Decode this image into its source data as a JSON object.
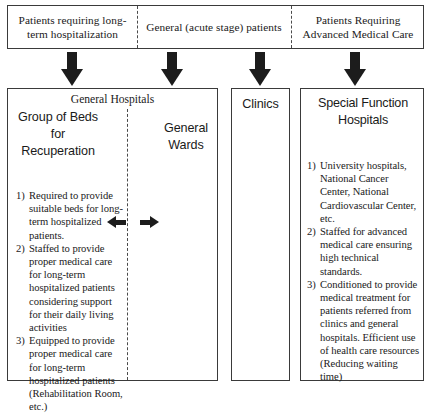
{
  "diagram": {
    "top_band": {
      "segments": [
        {
          "label": "Patients requiring long-term hospitalization"
        },
        {
          "label": "General (acute stage) patients"
        },
        {
          "label": "Patients Requiring Advanced Medical Care"
        }
      ]
    },
    "arrows": {
      "down_icon": "arrow-down-icon",
      "left_icon": "arrow-left-icon",
      "right_icon": "arrow-right-icon",
      "count": 4,
      "color": "#1c1c1c"
    },
    "general_hospitals": {
      "title": "General Hospitals",
      "left_column_title": "Group of Beds for Recuperation",
      "right_column_title": "General Wards",
      "items": [
        {
          "num": "1)",
          "text": "Required to provide suitable beds for long-term hospitalized patients."
        },
        {
          "num": "2)",
          "text": "Staffed to provide proper medical care for long-term hospitalized patients considering support for their daily living activities"
        },
        {
          "num": "3)",
          "text": "Equipped to provide proper medical care for long-term hospitalized patients (Rehabilitation Room, etc.)"
        }
      ]
    },
    "clinics": {
      "title": "Clinics"
    },
    "special_function_hospitals": {
      "title": "Special Function Hospitals",
      "items": [
        {
          "num": "1)",
          "text": "University hospitals, National Cancer Center, National Cardiovascular Center, etc."
        },
        {
          "num": "2)",
          "text": "Staffed for advanced medical care ensuring high technical standards."
        },
        {
          "num": "3)",
          "text": "Conditioned to provide medical treatment for patients referred from clinics and general hospitals. Efficient use of health care resources (Reducing waiting time)"
        }
      ]
    }
  }
}
